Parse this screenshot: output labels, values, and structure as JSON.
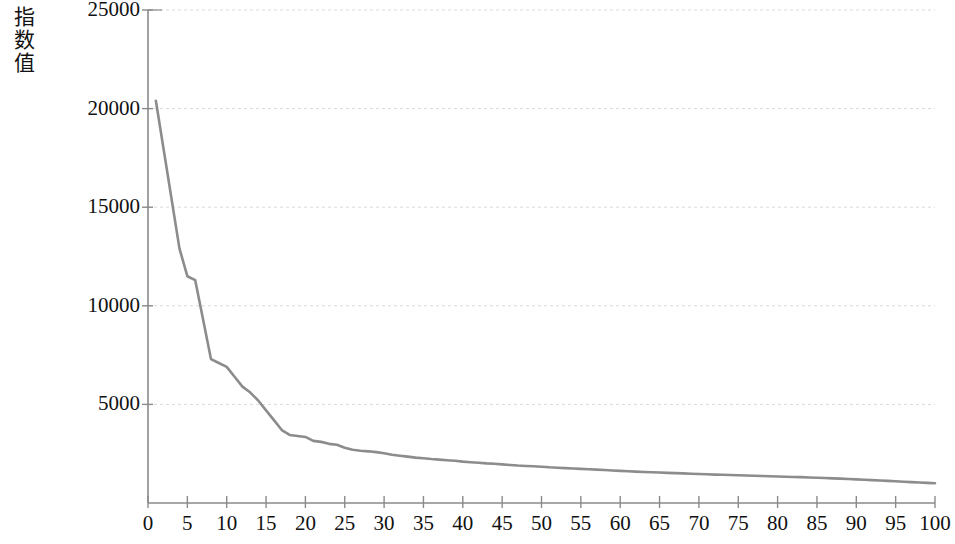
{
  "chart_data": {
    "type": "line",
    "title": "",
    "subtitle": "",
    "xlabel": "",
    "ylabel": "指数值",
    "xlim": [
      0,
      100
    ],
    "ylim": [
      0,
      25000
    ],
    "grid": "horizontal",
    "legend": null,
    "line_color": "#8c8c8c",
    "axis_color": "#8a8a8a",
    "grid_color": "#d9d9d9",
    "y_ticks": [
      25000,
      20000,
      15000,
      10000,
      5000
    ],
    "y_tick_labels": [
      "25000",
      "20000",
      "15000",
      "10000",
      "5000"
    ],
    "x_ticks": [
      0,
      5,
      10,
      15,
      20,
      25,
      30,
      35,
      40,
      45,
      50,
      55,
      60,
      65,
      70,
      75,
      80,
      85,
      90,
      95,
      100
    ],
    "x_tick_labels": [
      "0",
      "5",
      "10",
      "15",
      "20",
      "25",
      "30",
      "35",
      "40",
      "45",
      "50",
      "55",
      "60",
      "65",
      "70",
      "75",
      "80",
      "85",
      "90",
      "95",
      "100"
    ],
    "series": [
      {
        "name": "eigenvalue",
        "x": [
          1,
          2,
          3,
          4,
          5,
          6,
          7,
          8,
          9,
          10,
          11,
          12,
          13,
          14,
          15,
          16,
          17,
          18,
          19,
          20,
          21,
          22,
          23,
          24,
          25,
          26,
          27,
          28,
          29,
          30,
          31,
          32,
          33,
          34,
          35,
          36,
          37,
          38,
          39,
          40,
          41,
          42,
          43,
          44,
          45,
          46,
          47,
          48,
          49,
          50,
          51,
          52,
          53,
          54,
          55,
          56,
          57,
          58,
          59,
          60,
          61,
          62,
          63,
          64,
          65,
          66,
          67,
          68,
          69,
          70,
          71,
          72,
          73,
          74,
          75,
          76,
          77,
          78,
          79,
          80,
          81,
          82,
          83,
          84,
          85,
          86,
          87,
          88,
          89,
          90,
          91,
          92,
          93,
          94,
          95,
          96,
          97,
          98,
          99,
          100
        ],
        "values": [
          20400,
          17900,
          15400,
          12900,
          11500,
          11300,
          9300,
          7300,
          7100,
          6900,
          6400,
          5900,
          5600,
          5200,
          4700,
          4200,
          3700,
          3450,
          3400,
          3350,
          3150,
          3100,
          3000,
          2950,
          2800,
          2700,
          2650,
          2620,
          2580,
          2520,
          2450,
          2400,
          2350,
          2300,
          2270,
          2230,
          2200,
          2170,
          2140,
          2100,
          2070,
          2040,
          2010,
          1990,
          1960,
          1930,
          1900,
          1880,
          1860,
          1840,
          1810,
          1790,
          1770,
          1750,
          1730,
          1710,
          1690,
          1670,
          1650,
          1630,
          1610,
          1590,
          1575,
          1560,
          1545,
          1530,
          1515,
          1500,
          1485,
          1470,
          1455,
          1440,
          1430,
          1420,
          1410,
          1395,
          1380,
          1370,
          1360,
          1345,
          1330,
          1320,
          1310,
          1295,
          1280,
          1265,
          1250,
          1235,
          1220,
          1200,
          1180,
          1160,
          1140,
          1120,
          1100,
          1080,
          1060,
          1040,
          1020,
          1000
        ]
      }
    ]
  }
}
